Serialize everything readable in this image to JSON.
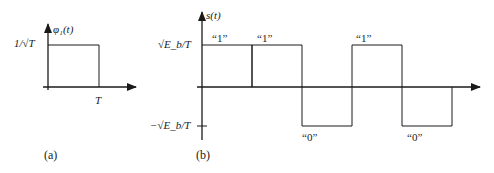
{
  "panel_a": {
    "caption": "(a)",
    "y_label": "φ₁(t)",
    "level_label": "1/√T",
    "x_tick_label": "T",
    "pulse": {
      "t_start": 0,
      "t_end": 1,
      "amplitude_label": "1/√T"
    }
  },
  "panel_b": {
    "caption": "(b)",
    "y_label": "s(t)",
    "pos_level_label": "√E_b/T",
    "neg_level_label": "−√E_b/T",
    "bits": [
      {
        "label": "“1”",
        "value": 1
      },
      {
        "label": "“1”",
        "value": 1
      },
      {
        "label": "“0”",
        "value": 0
      },
      {
        "label": "“1”",
        "value": 1
      },
      {
        "label": "“0”",
        "value": 0
      }
    ]
  },
  "colors": {
    "ink": "#1a1a1a",
    "background": "#ffffff"
  }
}
